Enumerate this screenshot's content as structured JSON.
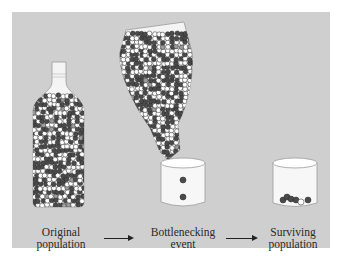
{
  "figure": {
    "topic": "Bottleneck effect",
    "colors": {
      "panel": "#cfcfcf",
      "glass_fill": "#f4f4f4",
      "glass_stroke": "#9a9a9a",
      "bead_dark": "#4a4a4a",
      "bead_white": "#ffffff",
      "bead_gray": "#9c9c9c",
      "bead_stroke": "#2a2a2a",
      "arrow": "#222222"
    },
    "stages": [
      {
        "id": "original",
        "label_line1": "Original",
        "label_line2": "population"
      },
      {
        "id": "bottleneck",
        "label_line1": "Bottlenecking",
        "label_line2": "event"
      },
      {
        "id": "surviving",
        "label_line1": "Surviving",
        "label_line2": "population"
      }
    ],
    "arrows": [
      {
        "from": "original",
        "to": "bottleneck"
      },
      {
        "from": "bottleneck",
        "to": "surviving"
      }
    ],
    "bottleneck_glass_beads": [
      "dark",
      "dark"
    ],
    "surviving_beads": [
      "dark",
      "dark",
      "dark",
      "dark",
      "white",
      "dark"
    ]
  }
}
